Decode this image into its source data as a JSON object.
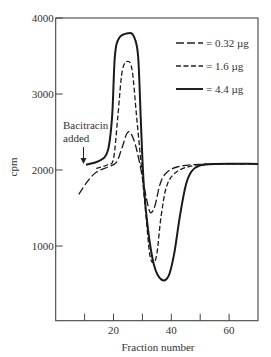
{
  "chart_data": {
    "type": "line",
    "title": "",
    "xlabel": "Fraction number",
    "ylabel": "cpm",
    "xlim": [
      0,
      70
    ],
    "ylim": [
      0,
      4000
    ],
    "xticks": [
      10,
      20,
      30,
      40,
      50,
      60
    ],
    "xtick_labels": [
      "",
      "20",
      "",
      "40",
      "",
      "60"
    ],
    "yticks": [
      1000,
      2000,
      3000,
      4000
    ],
    "ytick_labels": [
      "1000",
      "2000",
      "3000",
      "4000"
    ],
    "grid": false,
    "legend_position": "upper right",
    "annotations": [
      {
        "text_lines": [
          "Bacitracin",
          "added"
        ],
        "arrow_to": [
          10,
          2070
        ]
      }
    ],
    "series": [
      {
        "name": "= 0.32 µg",
        "style": "long-dash",
        "x": [
          8,
          11,
          14,
          18,
          21,
          23,
          25,
          27,
          29,
          31,
          32.3,
          33.2,
          34.5,
          36,
          38,
          42,
          50,
          70
        ],
        "y": [
          1680,
          1850,
          1970,
          2040,
          2100,
          2300,
          2500,
          2400,
          2100,
          1700,
          1480,
          1440,
          1550,
          1800,
          1950,
          2040,
          2075,
          2080
        ]
      },
      {
        "name": "= 1.6 µg",
        "style": "short-dash",
        "x": [
          14,
          18,
          20,
          21.5,
          23,
          25,
          26.5,
          28,
          29.5,
          31,
          32.5,
          33.8,
          35,
          36.5,
          38.5,
          42,
          48,
          55,
          70
        ],
        "y": [
          2020,
          2070,
          2150,
          2700,
          3300,
          3430,
          3300,
          2700,
          2100,
          1500,
          900,
          780,
          900,
          1400,
          1800,
          1980,
          2060,
          2080,
          2080
        ]
      },
      {
        "name": "= 4.4 µg",
        "style": "solid",
        "x": [
          10.5,
          15,
          18,
          19.5,
          20.5,
          22,
          25,
          27,
          28.5,
          29.5,
          30.5,
          32,
          34,
          36.5,
          39,
          41,
          43,
          45,
          47,
          50,
          55,
          70
        ],
        "y": [
          2070,
          2120,
          2250,
          2700,
          3500,
          3740,
          3800,
          3760,
          3500,
          2600,
          1800,
          1200,
          750,
          560,
          600,
          900,
          1400,
          1800,
          1980,
          2060,
          2080,
          2080
        ]
      }
    ]
  },
  "annotation": {
    "line1": "Bacitracin",
    "line2": "added"
  },
  "axes": {
    "xlabel": "Fraction number",
    "ylabel": "cpm"
  },
  "legend": [
    {
      "label": "= 0.32 µg"
    },
    {
      "label": "= 1.6 µg"
    },
    {
      "label": "= 4.4 µg"
    }
  ]
}
